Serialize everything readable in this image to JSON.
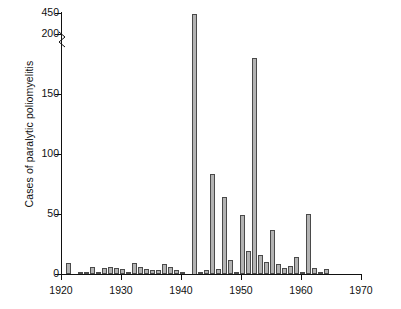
{
  "chart_data": {
    "type": "bar",
    "title": "",
    "xlabel": "",
    "ylabel": "Cases of paralytic poliomyelitis",
    "xlim": [
      1920,
      1970
    ],
    "ylim": [
      0,
      200
    ],
    "y_axis_break": {
      "below": 200,
      "above": 450,
      "label_top": "450"
    },
    "yticks": [
      0,
      50,
      100,
      150,
      200,
      450
    ],
    "ytick_labels": [
      "0",
      "50",
      "100",
      "150",
      "200",
      "450"
    ],
    "xticks": [
      1920,
      1930,
      1940,
      1950,
      1960,
      1970
    ],
    "xtick_labels": [
      "1920",
      "1930",
      "1940",
      "1950",
      "1960",
      "1970"
    ],
    "grid": false,
    "legend": null,
    "bar_color": "#b3b3b3",
    "bar_edge_color": "#4a4a4a",
    "categories": [
      1921,
      1922,
      1923,
      1924,
      1925,
      1926,
      1927,
      1928,
      1929,
      1930,
      1931,
      1932,
      1933,
      1934,
      1935,
      1936,
      1937,
      1938,
      1939,
      1940,
      1941,
      1942,
      1943,
      1944,
      1945,
      1946,
      1947,
      1948,
      1949,
      1950,
      1951,
      1952,
      1953,
      1954,
      1955,
      1956,
      1957,
      1958,
      1959,
      1960,
      1961,
      1962,
      1963,
      1964
    ],
    "values": [
      9,
      0,
      2,
      1,
      6,
      2,
      5,
      6,
      5,
      4,
      2,
      9,
      6,
      4,
      3,
      3,
      8,
      6,
      3,
      1,
      0,
      450,
      1,
      3,
      83,
      4,
      64,
      12,
      2,
      49,
      19,
      180,
      16,
      10,
      37,
      8,
      5,
      7,
      14,
      2,
      50,
      5,
      1,
      4
    ]
  }
}
